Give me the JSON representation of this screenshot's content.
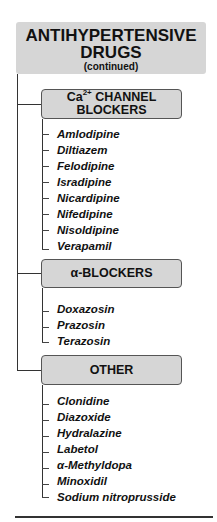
{
  "title": {
    "line1": "ANTIHYPERTENSIVE",
    "line2": "DRUGS",
    "subtitle": "(continued)"
  },
  "categories": [
    {
      "label_prefix": "Ca",
      "label_sup": "2+",
      "label_rest": " CHANNEL",
      "label_line2": "BLOCKERS",
      "drugs": [
        "Amlodipine",
        "Diltiazem",
        "Felodipine",
        "Isradipine",
        "Nicardipine",
        "Nifedipine",
        "Nisoldipine",
        "Verapamil"
      ]
    },
    {
      "label": "α-BLOCKERS",
      "drugs": [
        "Doxazosin",
        "Prazosin",
        "Terazosin"
      ]
    },
    {
      "label": "OTHER",
      "drugs": [
        "Clonidine",
        "Diazoxide",
        "Hydralazine",
        "Labetol",
        "α-Methyldopa",
        "Minoxidil",
        "Sodium nitroprusside"
      ]
    }
  ],
  "colors": {
    "box_fill": "#d6d6d6",
    "box_border": "#555555",
    "line": "#333333",
    "text": "#111111"
  }
}
